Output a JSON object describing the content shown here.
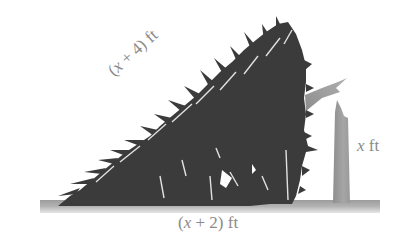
{
  "figure": {
    "labels": {
      "hypotenuse": {
        "var": "x",
        "text_open": "(",
        "text_op": " + 4) ",
        "unit": "ft"
      },
      "height": {
        "var": "x",
        "text_op": " ",
        "unit": "ft"
      },
      "base": {
        "var": "x",
        "text_open": "(",
        "text_op": " + 2) ",
        "unit": "ft"
      }
    },
    "colors": {
      "tree": "#3a3a3a",
      "stump": "#9a9a9a",
      "ground": "#a8a8a8",
      "label": "#8a8a8a"
    }
  }
}
